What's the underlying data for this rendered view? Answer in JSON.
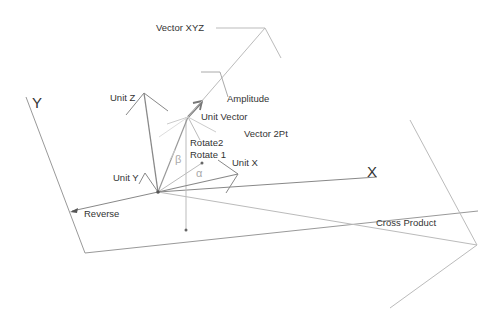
{
  "diagram": {
    "axes": {
      "x_label": "X",
      "y_label": "Y"
    },
    "labels": {
      "vector_xyz": "Vector XYZ",
      "amplitude": "Amplitude",
      "unit_vector": "Unit Vector",
      "vector_2pt": "Vector 2Pt",
      "rotate2": "Rotate2",
      "rotate1": "Rotate 1",
      "unit_x": "Unit X",
      "unit_y": "Unit Y",
      "unit_z": "Unit Z",
      "reverse": "Reverse",
      "cross_product": "Cross Product"
    },
    "angles": {
      "alpha": "α",
      "beta": "β"
    },
    "colors": {
      "dark_line": "#777777",
      "light_line": "#bbbbbb",
      "text": "#333333",
      "greek": "#aaaaaa"
    }
  }
}
